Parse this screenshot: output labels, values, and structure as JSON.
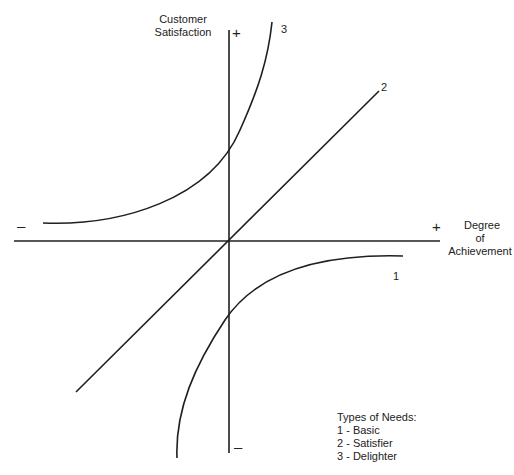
{
  "diagram": {
    "y_axis": {
      "label_line1": "Customer",
      "label_line2": "Satisfaction",
      "positive_sign": "+",
      "negative_sign": "–"
    },
    "x_axis": {
      "label_line1": "Degree",
      "label_line2": "of",
      "label_line3": "Achievement",
      "positive_sign": "+",
      "negative_sign": "–"
    },
    "curves": [
      {
        "id": "1",
        "label": "1",
        "name": "Basic"
      },
      {
        "id": "2",
        "label": "2",
        "name": "Satisfier"
      },
      {
        "id": "3",
        "label": "3",
        "name": "Delighter"
      }
    ],
    "legend": {
      "title": "Types of Needs:",
      "items": [
        "1 - Basic",
        "2 - Satisfier",
        "3 - Delighter"
      ]
    },
    "colors": {
      "line": "#1f1f1f",
      "background": "#ffffff",
      "text": "#222222"
    }
  }
}
